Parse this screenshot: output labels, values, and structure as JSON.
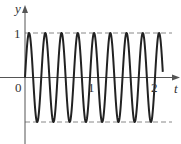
{
  "chart_data": {
    "type": "line",
    "title": "",
    "xlabel": "t",
    "ylabel": "y",
    "function": "y = sin(8πt)",
    "x_ticks": [
      {
        "value": 0,
        "label": "0"
      },
      {
        "value": 1,
        "label": "1"
      },
      {
        "value": 2,
        "label": "2"
      }
    ],
    "y_ticks": [
      {
        "value": 1,
        "label": "1"
      },
      {
        "value": -1,
        "label": ""
      }
    ],
    "xlim": [
      0,
      2.12
    ],
    "ylim": [
      -1,
      1
    ],
    "reference_lines": [
      {
        "y": 1,
        "style": "dashed"
      },
      {
        "y": -1,
        "style": "dashed"
      }
    ],
    "series": [
      {
        "name": "y(t)",
        "t_start": 0,
        "t_end": 2.12,
        "frequency_cycles_per_unit": 4,
        "amplitude": 1,
        "peaks_t": [
          0.0625,
          0.3125,
          0.5625,
          0.8125,
          1.0625,
          1.3125,
          1.5625,
          1.8125,
          2.0625
        ],
        "troughs_t": [
          0.1875,
          0.4375,
          0.6875,
          0.9375,
          1.1875,
          1.4375,
          1.6875,
          1.9375
        ]
      }
    ],
    "grid": false,
    "legend": null
  },
  "labels": {
    "y_axis": "y",
    "x_axis": "t",
    "origin": "0",
    "y_one": "1",
    "x_one": "1",
    "x_two": "2"
  },
  "colors": {
    "curve": "#222222",
    "axis": "#555555",
    "dashed": "#777777"
  }
}
